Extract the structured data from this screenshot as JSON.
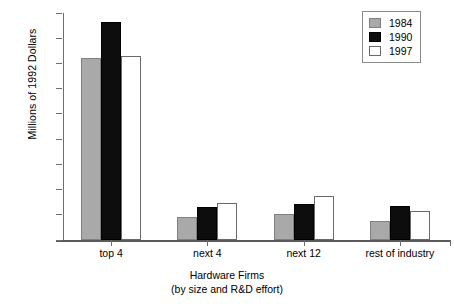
{
  "chart_data": {
    "type": "bar",
    "title": "",
    "xlabel": "Hardware Firms (by size and R&D effort)",
    "xlabel_line1": "Hardware Firms",
    "xlabel_line2": "(by size and R&D effort)",
    "ylabel": "Millions of 1992 Dollars",
    "categories": [
      "top 4",
      "next 4",
      "next 12",
      "rest of industry"
    ],
    "series": [
      {
        "name": "1984",
        "color": "#a9a9a9",
        "values": [
          7230,
          920,
          1030,
          750
        ]
      },
      {
        "name": "1990",
        "color": "#0d0d0d",
        "values": [
          8650,
          1310,
          1430,
          1350
        ]
      },
      {
        "name": "1997",
        "color": "#ffffff",
        "values": [
          7280,
          1480,
          1730,
          1170
        ]
      }
    ],
    "ylim": [
      0,
      9000
    ],
    "yticks": [
      0,
      1000,
      2000,
      3000,
      4000,
      5000,
      6000,
      7000,
      8000,
      9000
    ],
    "ytick_labels": [
      "0",
      "1000",
      "2000",
      "3000",
      "4000",
      "5000",
      "6000",
      "7000",
      "8000",
      "9000"
    ],
    "grid": false,
    "legend_position": "top-right",
    "legend_entries": [
      "1984",
      "1990",
      "1997"
    ]
  }
}
